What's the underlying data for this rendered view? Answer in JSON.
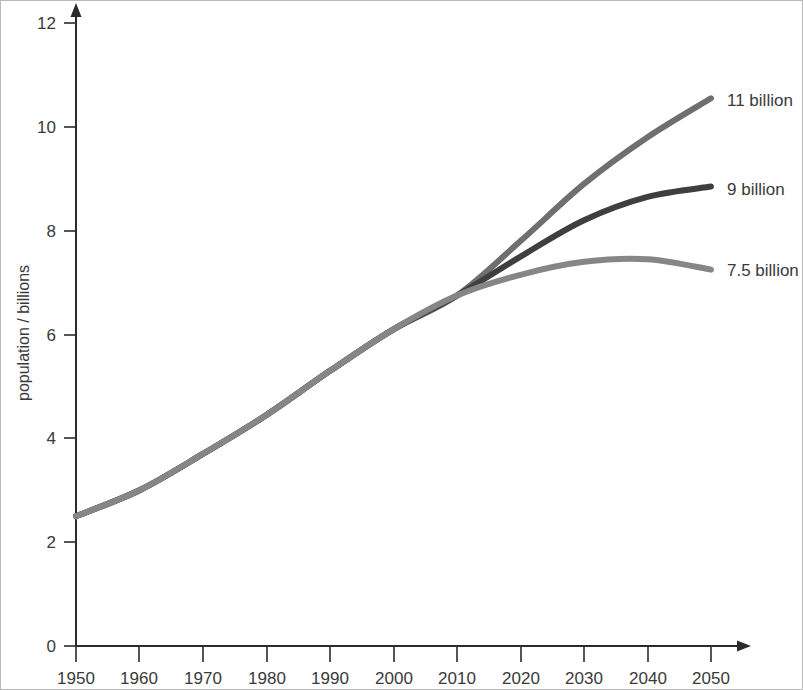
{
  "chart_data": {
    "type": "line",
    "title": "",
    "subtitle": "",
    "xlabel": "",
    "ylabel": "population / billions",
    "xlim": [
      1950,
      2050
    ],
    "ylim": [
      0,
      12
    ],
    "grid": false,
    "legend_position": "right-end-labels",
    "x_ticks": [
      "1950",
      "1960",
      "1970",
      "1980",
      "1990",
      "2000",
      "2010",
      "2020",
      "2030",
      "2040",
      "2050"
    ],
    "y_ticks": [
      "0",
      "2",
      "4",
      "6",
      "8",
      "10",
      "12"
    ],
    "x": [
      1950,
      1960,
      1970,
      1980,
      1990,
      2000,
      2010,
      2020,
      2030,
      2040,
      2050
    ],
    "series": [
      {
        "name": "11 billion",
        "label": "11 billion",
        "color": "#6f6f6f",
        "values": [
          2.5,
          3.0,
          3.7,
          4.45,
          5.3,
          6.1,
          6.75,
          7.8,
          8.9,
          9.8,
          10.55
        ]
      },
      {
        "name": "9 billion",
        "label": "9 billion",
        "color": "#3f3f3f",
        "values": [
          2.5,
          3.0,
          3.7,
          4.45,
          5.3,
          6.1,
          6.75,
          7.5,
          8.2,
          8.65,
          8.85
        ]
      },
      {
        "name": "7.5 billion",
        "label": "7.5 billion",
        "color": "#868686",
        "values": [
          2.5,
          3.0,
          3.7,
          4.45,
          5.3,
          6.1,
          6.75,
          7.15,
          7.4,
          7.45,
          7.25
        ]
      }
    ],
    "annotations": [
      {
        "text": "11 billion",
        "at_x": 2050,
        "at_y": 10.55
      },
      {
        "text": "9 billion",
        "at_x": 2050,
        "at_y": 8.85
      },
      {
        "text": "7.5 billion",
        "at_x": 2050,
        "at_y": 7.25
      }
    ]
  },
  "axes": {
    "y_title": "population / billions",
    "y_tick_labels": [
      "12",
      "10",
      "8",
      "6",
      "4",
      "2",
      "0"
    ],
    "x_tick_labels": [
      "1950",
      "1960",
      "1970",
      "1980",
      "1990",
      "2000",
      "2010",
      "2020",
      "2030",
      "2040",
      "2050"
    ]
  },
  "labels": {
    "high": "11 billion",
    "medium": "9 billion",
    "low": "7.5 billion"
  },
  "colors": {
    "high_curve": "#6f6f6f",
    "medium_curve": "#3f3f3f",
    "low_curve": "#868686",
    "axis": "#2b2b2b",
    "text": "#3a3a3a",
    "background": "#ffffff",
    "border": "#b9b9b9"
  }
}
